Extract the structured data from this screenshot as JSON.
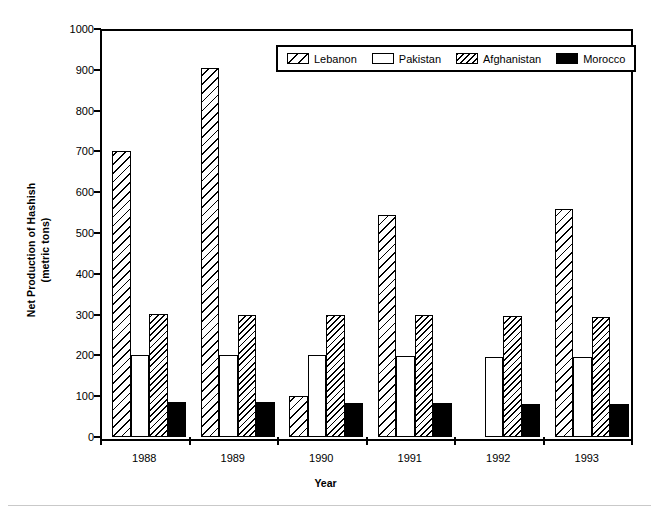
{
  "chart_data": {
    "type": "bar",
    "title": "",
    "xlabel": "Year",
    "ylabel": "Net Production of Hashish\n(metric tons)",
    "ylabel_line1": "Net Production of Hashish",
    "ylabel_line2": "(metric tons)",
    "categories": [
      "1988",
      "1989",
      "1990",
      "1991",
      "1992",
      "1993"
    ],
    "ylim": [
      0,
      1000
    ],
    "yticks": [
      0,
      100,
      200,
      300,
      400,
      500,
      600,
      700,
      800,
      900,
      1000
    ],
    "ytick_labels": [
      "0",
      "100",
      "200",
      "300",
      "400",
      "500",
      "600",
      "700",
      "800",
      "900",
      "1000"
    ],
    "grid": false,
    "legend_position": "top-center-inside",
    "series": [
      {
        "name": "Lebanon",
        "pattern": "diagonal-hatch-wide",
        "color": "#000000",
        "fill": "#ffffff",
        "values": [
          700,
          905,
          100,
          544,
          0,
          560
        ]
      },
      {
        "name": "Pakistan",
        "pattern": "solid-white",
        "color": "#000000",
        "fill": "#ffffff",
        "values": [
          200,
          200,
          200,
          198,
          197,
          195
        ]
      },
      {
        "name": "Afghanistan",
        "pattern": "diagonal-hatch-dense",
        "color": "#000000",
        "fill": "#ffffff",
        "values": [
          301,
          300,
          299,
          298,
          297,
          295
        ]
      },
      {
        "name": "Morocco",
        "pattern": "solid-black",
        "color": "#000000",
        "fill": "#000000",
        "values": [
          86,
          85,
          84,
          83,
          81,
          80
        ]
      }
    ]
  },
  "axes": {
    "x_axis_title": "Year",
    "y_axis_title_line1": "Net Production of Hashish",
    "y_axis_title_line2": "(metric tons)"
  },
  "legend": {
    "entries": [
      {
        "label": "Lebanon",
        "swatch": "hatch-wide-swatch"
      },
      {
        "label": "Pakistan",
        "swatch": "white-swatch"
      },
      {
        "label": "Afghanistan",
        "swatch": "hatch-dense-swatch"
      },
      {
        "label": "Morocco",
        "swatch": "black-swatch"
      }
    ]
  }
}
